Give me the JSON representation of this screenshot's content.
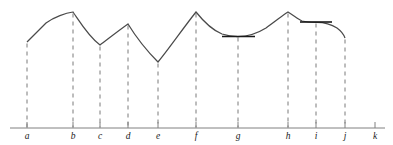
{
  "figure": {
    "title": "",
    "colors": {
      "curve": "#4a4a4a",
      "axis": "#808080",
      "dashed": "#7a7a7a",
      "tangent": "#1a1a1a",
      "label": "#1a1a1a",
      "background": "#ffffff"
    }
  },
  "chart_data": {
    "type": "line",
    "title": "",
    "xlabel": "",
    "ylabel": "",
    "xlim": [
      10,
      385
    ],
    "ylim": [
      128,
      5
    ],
    "grid": false,
    "legend": null,
    "tick_labels": [
      "a",
      "b",
      "c",
      "d",
      "e",
      "f",
      "g",
      "h",
      "i",
      "j",
      "k"
    ],
    "tick_x": [
      27,
      73,
      100,
      128,
      158,
      196,
      238,
      288,
      316,
      345,
      375
    ],
    "axis_y": 128,
    "axis_x_start": 10,
    "axis_x_end": 385,
    "points": [
      {
        "label": "a",
        "x": 27,
        "y": 42,
        "kind": "endpoint-left",
        "on_curve": true,
        "dashed": true
      },
      {
        "label": "b",
        "x": 73,
        "y": 12,
        "kind": "corner-maximum",
        "on_curve": true,
        "dashed": true
      },
      {
        "label": "c",
        "x": 100,
        "y": 45,
        "kind": "corner-minimum",
        "on_curve": true,
        "dashed": true
      },
      {
        "label": "d",
        "x": 128,
        "y": 24,
        "kind": "corner-maximum",
        "on_curve": true,
        "dashed": true
      },
      {
        "label": "e",
        "x": 158,
        "y": 62,
        "kind": "corner-minimum",
        "on_curve": true,
        "dashed": true
      },
      {
        "label": "f",
        "x": 196,
        "y": 12,
        "kind": "corner-maximum",
        "on_curve": true,
        "dashed": true
      },
      {
        "label": "g",
        "x": 238,
        "y": 36,
        "kind": "smooth-minimum",
        "on_curve": true,
        "dashed": true
      },
      {
        "label": "h",
        "x": 288,
        "y": 12,
        "kind": "corner-maximum",
        "on_curve": true,
        "dashed": true
      },
      {
        "label": "i",
        "x": 316,
        "y": 22,
        "kind": "smooth-maximum",
        "on_curve": true,
        "dashed": true
      },
      {
        "label": "j",
        "x": 345,
        "y": 38,
        "kind": "endpoint-right",
        "on_curve": true,
        "dashed": true
      },
      {
        "label": "k",
        "x": 375,
        "y": null,
        "kind": "axis-only",
        "on_curve": false,
        "dashed": false
      }
    ],
    "curve_path": "M 27 42 C 34 35 40 29 46 23 C 54 17 66 13 73 12 C 78 19 88 36 100 45 C 108 39 118 31 128 24 C 136 37 148 52 158 62 C 168 50 184 27 196 12 C 204 22 212 30 222 34 C 228 36 234 36.5 238 36.5 C 248 36.5 258 33 266 28 C 276 21 283 15 288 12 C 293 15 298 19 302 21 C 307 22.2 312 22.3 316 22.3 C 324 22.2 331 24 337 28 C 341 31 344 35 345 38",
    "tangents": [
      {
        "at": "g",
        "x1": 222,
        "x2": 255,
        "y": 36.5,
        "slope": 0
      },
      {
        "at": "i",
        "x1": 300,
        "x2": 332,
        "y": 22.0,
        "slope": 0
      }
    ],
    "tick_mark_height": 6
  }
}
